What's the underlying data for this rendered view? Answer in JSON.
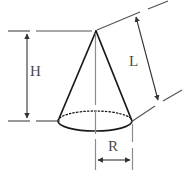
{
  "figure": {
    "name": "cone-dimension-diagram",
    "background_color": "#ffffff",
    "stroke_color": "#1a1a1a",
    "dimension_line_color": "#555555",
    "label_color": "#4a4a4a",
    "hidden_edge_style": "dotted"
  },
  "shape": {
    "type": "cone",
    "apex": {
      "x": 96,
      "y": 31
    },
    "base_center": {
      "x": 95,
      "y": 121
    },
    "base_rx": 37,
    "base_ry": 10
  },
  "labels": {
    "height": "H",
    "slant": "L",
    "radius": "R"
  },
  "dimensions": [
    {
      "key": "height",
      "label": "H",
      "orientation": "vertical",
      "from": {
        "x": 27,
        "y": 31
      },
      "to": {
        "x": 27,
        "y": 121
      },
      "arrowheads": "both"
    },
    {
      "key": "slant",
      "label": "L",
      "orientation": "slanted",
      "from": {
        "x": 135,
        "y": 14
      },
      "to": {
        "x": 160,
        "y": 102
      },
      "arrowheads": "both"
    },
    {
      "key": "radius",
      "label": "R",
      "orientation": "horizontal",
      "from": {
        "x": 96,
        "y": 160
      },
      "to": {
        "x": 132,
        "y": 160
      },
      "arrowheads": "both"
    }
  ]
}
